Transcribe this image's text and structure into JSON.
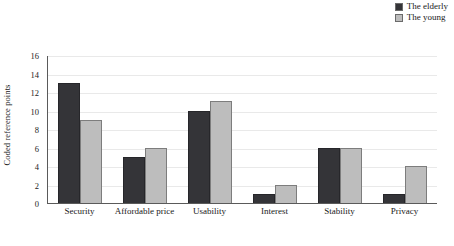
{
  "chart_data": {
    "type": "bar",
    "title": "",
    "subtitle": "",
    "xlabel": "",
    "ylabel": "Coded reference points",
    "categories": [
      "Security",
      "Affordable price",
      "Usability",
      "Interest",
      "Stability",
      "Privacy"
    ],
    "series": [
      {
        "name": "The elderly",
        "color": "#343438",
        "values": [
          13,
          5,
          10,
          1,
          6,
          1
        ]
      },
      {
        "name": "The young",
        "color": "#bdbdbd",
        "values": [
          9,
          6,
          11,
          2,
          6,
          4
        ]
      }
    ],
    "ylim": [
      0,
      16
    ],
    "ytick_labels": [
      "16",
      "14",
      "12",
      "10",
      "8",
      "6",
      "4",
      "2",
      "0"
    ],
    "ytick_values": [
      16,
      14,
      12,
      10,
      8,
      6,
      4,
      2,
      0
    ],
    "ytick_step": 2,
    "grid": true,
    "grid_axis": "y",
    "grid_color": "#e9e9e9",
    "legend_position": "top-right",
    "background_color": "#ffffff",
    "axis_color": "#5a5a5a"
  },
  "legend": {
    "items": [
      {
        "label": "The elderly",
        "swatch": "legend-swatch-elderly"
      },
      {
        "label": "The young",
        "swatch": "legend-swatch-young"
      }
    ]
  }
}
